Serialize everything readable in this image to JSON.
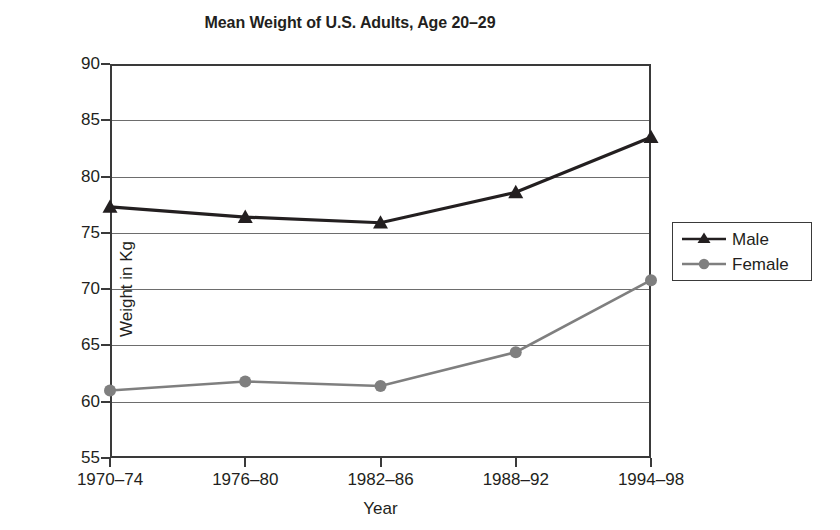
{
  "chart_data": {
    "type": "line",
    "title": "Mean Weight of U.S. Adults, Age 20–29",
    "xlabel": "Year",
    "ylabel": "Weight in Kg",
    "categories": [
      "1970–74",
      "1976–80",
      "1982–86",
      "1988–92",
      "1994–98"
    ],
    "series": [
      {
        "name": "Male",
        "values": [
          77.3,
          76.4,
          75.9,
          78.6,
          83.5
        ],
        "color": "#231f20",
        "marker": "triangle"
      },
      {
        "name": "Female",
        "values": [
          61.0,
          61.8,
          61.4,
          64.4,
          70.8
        ],
        "color": "#7f7f7f",
        "marker": "circle"
      }
    ],
    "ylim": [
      55,
      90
    ],
    "yticks": [
      55,
      60,
      65,
      70,
      75,
      80,
      85,
      90
    ],
    "ytick_labels": [
      "55",
      "60",
      "65",
      "70",
      "75",
      "80",
      "85",
      "90"
    ],
    "grid": "horizontal",
    "legend_position": "right"
  },
  "legend": {
    "entries": [
      {
        "label": "Male",
        "icon": "triangle-marker-icon"
      },
      {
        "label": "Female",
        "icon": "circle-marker-icon"
      }
    ]
  },
  "colors": {
    "male": "#231f20",
    "female": "#7f7f7f",
    "axis": "#3a3a3a",
    "grid": "#6d6d6d",
    "background": "#ffffff"
  }
}
